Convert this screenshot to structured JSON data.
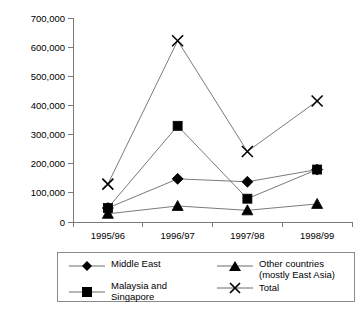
{
  "chart_data": {
    "type": "line",
    "title": "",
    "xlabel": "",
    "ylabel": "",
    "categories": [
      "1995/96",
      "1996/97",
      "1997/98",
      "1998/99"
    ],
    "ylim": [
      0,
      700000
    ],
    "ytick_labels": [
      "0",
      "100,000",
      "200,000",
      "300,000",
      "400,000",
      "500,000",
      "600,000",
      "700,000"
    ],
    "ytick_values": [
      0,
      100000,
      200000,
      300000,
      400000,
      500000,
      600000,
      700000
    ],
    "grid": false,
    "legend_position": "bottom",
    "series": [
      {
        "name": "Middle East",
        "marker": "diamond",
        "values": [
          48000,
          148000,
          138000,
          180000
        ]
      },
      {
        "name": "Other countries\n(mostly East Asia)",
        "marker": "triangle",
        "values": [
          28000,
          55000,
          40000,
          62000
        ]
      },
      {
        "name": "Malaysia and Singapore",
        "marker": "square",
        "values": [
          48000,
          330000,
          80000,
          180000
        ]
      },
      {
        "name": "Total",
        "marker": "x",
        "values": [
          130000,
          622000,
          242000,
          415000
        ]
      }
    ]
  },
  "legend": {
    "items": [
      {
        "label": "Middle East",
        "marker": "diamond"
      },
      {
        "label": "Other countries\n(mostly East Asia)",
        "marker": "triangle"
      },
      {
        "label": "Malaysia and Singapore",
        "marker": "square"
      },
      {
        "label": "Total",
        "marker": "x"
      }
    ]
  }
}
